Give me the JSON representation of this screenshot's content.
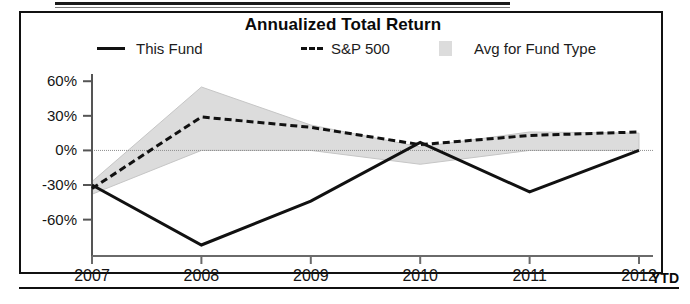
{
  "chart_data": {
    "type": "line",
    "title": "Annualized Total Return",
    "xlabel": "",
    "ylabel": "",
    "grid": false,
    "legend_position": "top",
    "categories": [
      "2007",
      "2008",
      "2009",
      "2010",
      "2011",
      "2012"
    ],
    "x_tick_labels": [
      "2007",
      "2008",
      "2009",
      "2010",
      "2011",
      "2012"
    ],
    "x_tick_suffix": "YTD",
    "y_tick_labels": [
      "60%",
      "30%",
      "0%",
      "-30%",
      "-60%"
    ],
    "y_tick_values": [
      60,
      30,
      0,
      -30,
      -60
    ],
    "ylim": [
      -82,
      68
    ],
    "series": [
      {
        "name": "This Fund",
        "style": "solid",
        "color": "#111111",
        "values": [
          -30,
          -82,
          -44,
          7,
          -36,
          0
        ]
      },
      {
        "name": "S&P 500",
        "style": "dashed",
        "color": "#111111",
        "values": [
          -33,
          29,
          20,
          5,
          13,
          16
        ]
      },
      {
        "name": "Avg for Fund Type",
        "style": "band",
        "color": "#dcdcdc",
        "upper": [
          -27,
          55,
          22,
          3,
          16,
          15
        ],
        "lower": [
          -38,
          0,
          0,
          -12,
          0,
          0
        ]
      }
    ]
  },
  "chart": {
    "title": "Annualized Total Return",
    "legend": [
      {
        "label": "This Fund",
        "marker": "solid-line"
      },
      {
        "label": "S&P 500",
        "marker": "dashed-line"
      },
      {
        "label": "Avg for Fund Type",
        "marker": "gray-swatch"
      }
    ],
    "y_axis": {
      "ticks": [
        "60%",
        "30%",
        "0%",
        "-30%",
        "-60%"
      ]
    },
    "x_axis": {
      "ticks": [
        "2007",
        "2008",
        "2009",
        "2010",
        "2011",
        "2012"
      ],
      "suffix": "YTD"
    }
  },
  "colors": {
    "line": "#111111",
    "band": "#dcdcdc",
    "frame": "#111111",
    "axis": "#5a5a5a"
  }
}
